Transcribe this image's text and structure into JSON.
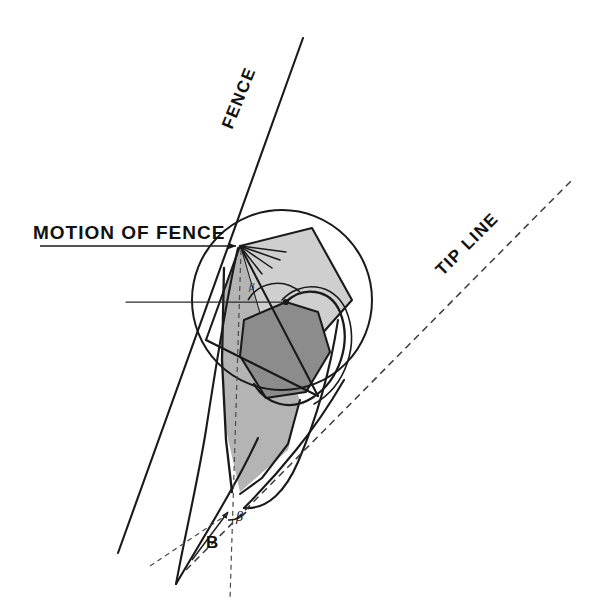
{
  "figure": {
    "background_color": "#ffffff",
    "width": 591,
    "height": 613
  },
  "labels": {
    "fence": "FENCE",
    "tip_line": "TIP LINE",
    "motion_of_fence": "MOTION OF FENCE",
    "point_b": "B",
    "beta_lower": "β",
    "beta_upper": "β"
  },
  "colors": {
    "ink": "#1a1a1a",
    "light_shape_fill": "#cfcfcf",
    "mid_shape_fill": "#b4b4b4",
    "dark_shape_fill": "#8c8c8c",
    "dash": "#3a3a3a",
    "background": "#ffffff"
  },
  "geometry": {
    "circle": {
      "cx": 282,
      "cy": 300,
      "r": 90
    },
    "apex_point": {
      "x": 240,
      "y": 246
    },
    "pivot_dot": {
      "x": 286,
      "y": 302
    },
    "motion_arrow": {
      "x1": 40,
      "y1": 246,
      "x2": 238,
      "y2": 246
    },
    "horizontal_lead": {
      "x1": 126,
      "y1": 302,
      "x2": 286,
      "y2": 302
    },
    "fence_line": {
      "x1": 118,
      "y1": 553,
      "x2": 302,
      "y2": 38
    },
    "tip_line": {
      "x1": 186,
      "y1": 570,
      "x2": 572,
      "y2": 180
    },
    "vertical_dash": {
      "x1": 240,
      "y1": 250,
      "x2": 230,
      "y2": 600
    }
  },
  "annotations": [
    {
      "name": "fence-line-label",
      "text": "FENCE",
      "rotation_deg": -70
    },
    {
      "name": "tip-line-label",
      "text": "TIP LINE",
      "rotation_deg": -45
    },
    {
      "name": "motion-of-fence-label",
      "text": "MOTION OF FENCE",
      "rotation_deg": 0
    },
    {
      "name": "point-b-label",
      "text": "B",
      "rotation_deg": 0
    },
    {
      "name": "beta-angle-label",
      "text": "β",
      "rotation_deg": 0
    }
  ]
}
